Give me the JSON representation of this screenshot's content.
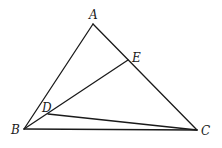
{
  "diagram": {
    "type": "geometry-triangle",
    "stroke_color": "#1a1a1a",
    "background": "#ffffff",
    "points": {
      "A": {
        "label": "A",
        "x": 93,
        "y": 24,
        "label_x": 89,
        "label_y": 19
      },
      "B": {
        "label": "B",
        "x": 24,
        "y": 129,
        "label_x": 11,
        "label_y": 134
      },
      "C": {
        "label": "C",
        "x": 197,
        "y": 130,
        "label_x": 201,
        "label_y": 135
      },
      "D": {
        "label": "D",
        "x": 48,
        "y": 114,
        "label_x": 42,
        "label_y": 112
      },
      "E": {
        "label": "E",
        "x": 128,
        "y": 60,
        "label_x": 132,
        "label_y": 62
      }
    },
    "segments": [
      {
        "from": "A",
        "to": "B"
      },
      {
        "from": "A",
        "to": "C"
      },
      {
        "from": "B",
        "to": "C"
      },
      {
        "from": "B",
        "to": "E"
      },
      {
        "from": "D",
        "to": "C"
      }
    ]
  }
}
